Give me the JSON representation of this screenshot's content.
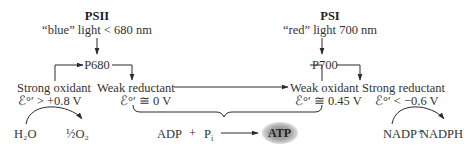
{
  "psii": {
    "title": "PSII",
    "light": "“blue” light  < 680 nm",
    "center": "P680",
    "oxidant_label": "Strong oxidant",
    "oxidant_potential": "ℰ°′ > +0.8 V",
    "reductant_label": "Weak reductant",
    "reductant_potential": "ℰ°′ ≅ 0 V",
    "water": "H₂O",
    "oxygen": "½O₂"
  },
  "psi": {
    "title": "PSI",
    "light": "“red” light  700 nm",
    "center": "P700",
    "oxidant_label": "Weak oxidant",
    "oxidant_potential": "ℰ°′ ≅ 0.45 V",
    "reductant_label": "Strong reductant",
    "reductant_potential": "ℰ°′ < −0.6 V",
    "nadp": "NADP⁺",
    "nadph": "NADPH"
  },
  "atp_synthesis": {
    "adp": "ADP",
    "plus": "+",
    "pi": "P",
    "pi_sub": "i",
    "atp": "ATP"
  },
  "colors": {
    "line": "#2a2a2a",
    "text": "#333333",
    "atp_glow": "#8a8a8a"
  }
}
